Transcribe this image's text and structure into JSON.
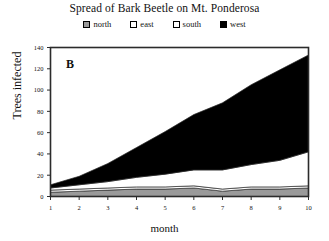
{
  "figure": {
    "title": "Spread of Bark Beetle on Mt. Ponderosa",
    "panel_letter": "B",
    "xlabel": "month",
    "ylabel": "Trees infected"
  },
  "legend": {
    "position": "top-center",
    "items": [
      {
        "label": "north",
        "color": "#9a9a9a"
      },
      {
        "label": "east",
        "color": "#ffffff"
      },
      {
        "label": "south",
        "color": "#ffffff"
      },
      {
        "label": "west",
        "color": "#000000"
      }
    ]
  },
  "axes": {
    "y_ticks": [
      "0",
      "20",
      "40",
      "60",
      "80",
      "100",
      "120",
      "140"
    ],
    "x_ticks": [
      "1",
      "2",
      "3",
      "4",
      "5",
      "6",
      "7",
      "8",
      "9",
      "10"
    ]
  },
  "chart_data": {
    "type": "area",
    "stacked": true,
    "title": "Spread of Bark Beetle on Mt. Ponderosa",
    "subtitle": "",
    "xlabel": "month",
    "ylabel": "Trees infected",
    "annotation": "B",
    "grid": false,
    "legend_position": "top-center",
    "x": [
      1,
      2,
      3,
      4,
      5,
      6,
      7,
      8,
      9,
      10
    ],
    "xlim": [
      1,
      10
    ],
    "ylim": [
      0,
      140
    ],
    "series": [
      {
        "name": "north",
        "color": "#9a9a9a",
        "values": [
          4,
          5,
          6,
          7,
          7,
          8,
          5,
          7,
          7,
          8
        ]
      },
      {
        "name": "east",
        "color": "#ffffff",
        "values": [
          2,
          2,
          2,
          2,
          2,
          2,
          2,
          2,
          2,
          2
        ]
      },
      {
        "name": "south",
        "color": "#ffffff",
        "values": [
          2,
          4,
          6,
          9,
          12,
          15,
          18,
          21,
          25,
          32
        ]
      },
      {
        "name": "west",
        "color": "#000000",
        "values": [
          3,
          8,
          17,
          28,
          40,
          52,
          63,
          75,
          85,
          91
        ]
      }
    ],
    "cumulative_totals": [
      11,
      19,
      31,
      46,
      61,
      77,
      88,
      105,
      119,
      133
    ]
  }
}
